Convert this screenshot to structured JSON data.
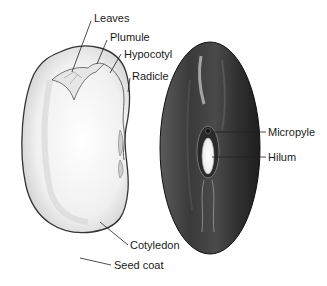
{
  "figure": {
    "left_view": "Internal view (opened seed)",
    "right_view": "External view (whole seed)"
  },
  "labels": {
    "leaves": "Leaves",
    "plumule": "Plumule",
    "hypocotyl": "Hypocotyl",
    "radicle": "Radicle",
    "micropyle": "Micropyle",
    "hilum": "Hilum",
    "cotyledon": "Cotyledon",
    "seed_coat": "Seed coat"
  },
  "colors": {
    "background": "#ffffff",
    "text": "#1a1a1a",
    "leader_line": "#222222",
    "inner_seed_fill": "#f2f2f2",
    "outer_seed_fill": "#3a3a3a",
    "hilum_fill": "#e8e8e8"
  }
}
